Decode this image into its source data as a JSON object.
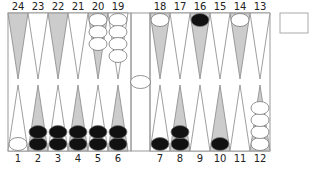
{
  "board": {
    "colors": {
      "background": "#ffffff",
      "frame": "#999999",
      "point_shaded": "#cccccc",
      "point_plain": "#ffffff",
      "point_stroke": "#888888",
      "checker_white": "#ffffff",
      "checker_black": "#111111",
      "checker_stroke": "#777777"
    },
    "top_labels": [
      "24",
      "23",
      "22",
      "21",
      "20",
      "19",
      "18",
      "17",
      "16",
      "15",
      "14",
      "13"
    ],
    "bottom_labels": [
      "1",
      "2",
      "3",
      "4",
      "5",
      "6",
      "7",
      "8",
      "9",
      "10",
      "11",
      "12"
    ],
    "points": {
      "1": {
        "color": "white",
        "count": 1
      },
      "2": {
        "color": "black",
        "count": 2
      },
      "3": {
        "color": "black",
        "count": 2
      },
      "4": {
        "color": "black",
        "count": 2
      },
      "5": {
        "color": "black",
        "count": 2
      },
      "6": {
        "color": "black",
        "count": 2
      },
      "7": {
        "color": "black",
        "count": 1
      },
      "8": {
        "color": "black",
        "count": 2
      },
      "9": {
        "color": "none",
        "count": 0
      },
      "10": {
        "color": "black",
        "count": 1
      },
      "11": {
        "color": "none",
        "count": 0
      },
      "12": {
        "color": "white",
        "count": 4
      },
      "13": {
        "color": "none",
        "count": 0
      },
      "14": {
        "color": "white",
        "count": 1
      },
      "15": {
        "color": "none",
        "count": 0
      },
      "16": {
        "color": "black",
        "count": 1
      },
      "17": {
        "color": "none",
        "count": 0
      },
      "18": {
        "color": "white",
        "count": 1
      },
      "19": {
        "color": "white",
        "count": 4
      },
      "20": {
        "color": "white",
        "count": 3
      },
      "21": {
        "color": "none",
        "count": 0
      },
      "22": {
        "color": "none",
        "count": 0
      },
      "23": {
        "color": "none",
        "count": 0
      },
      "24": {
        "color": "none",
        "count": 0
      }
    },
    "bar": {
      "white": 1,
      "black": 0
    },
    "doubling_cube": {
      "value": ""
    }
  }
}
